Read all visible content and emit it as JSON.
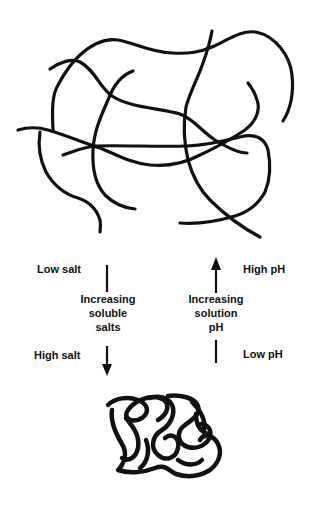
{
  "diagram": {
    "top_state": {
      "name": "extended-polymer-network"
    },
    "bottom_state": {
      "name": "collapsed-polymer-coil"
    },
    "left_axis": {
      "top_label": "Low salt",
      "bottom_label": "High salt",
      "middle_lines": [
        "Increasing",
        "soluble",
        "salts"
      ],
      "arrow_direction": "down"
    },
    "right_axis": {
      "top_label": "High pH",
      "bottom_label": "Low pH",
      "middle_lines": [
        "Increasing",
        "solution",
        "pH"
      ],
      "arrow_direction": "up"
    },
    "colors": {
      "stroke": "#111111",
      "background": "#ffffff"
    }
  }
}
